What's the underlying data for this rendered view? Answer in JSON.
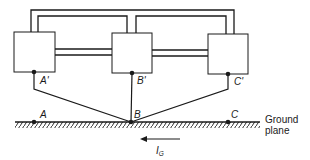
{
  "diagram": {
    "type": "grounding-circuit",
    "colors": {
      "stroke": "#1a1a1a",
      "background": "#ffffff"
    },
    "units": [
      {
        "id": "unit-a",
        "terminal_label": "A'"
      },
      {
        "id": "unit-b",
        "terminal_label": "B'"
      },
      {
        "id": "unit-c",
        "terminal_label": "C'"
      }
    ],
    "ground_points": [
      {
        "label": "A"
      },
      {
        "label": "B"
      },
      {
        "label": "C"
      }
    ],
    "ground_plane_label_line1": "Ground",
    "ground_plane_label_line2": "plane",
    "current": {
      "symbol": "I",
      "subscript": "G",
      "direction": "left"
    }
  }
}
